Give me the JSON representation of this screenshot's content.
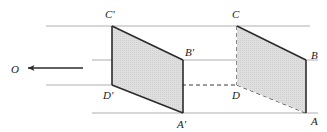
{
  "figure": {
    "background_color": "#ffffff",
    "stroke_color": "#2b2b2b",
    "guide_color": "#aeaeae",
    "fill_color": "#dcdcdc",
    "labels": {
      "center": "O",
      "near_top": "C'",
      "near_right": "B'",
      "near_bottom_left": "D'",
      "near_bottom": "A'",
      "far_top": "C",
      "far_right": "B",
      "far_bottom_left": "D",
      "far_bottom": "A"
    },
    "label_positions": {
      "center": {
        "x": 13,
        "y": 72
      },
      "near_top": {
        "x": 106,
        "y": 17
      },
      "near_right": {
        "x": 186,
        "y": 54
      },
      "near_bottom_left": {
        "x": 104,
        "y": 98
      },
      "near_bottom": {
        "x": 178,
        "y": 127
      },
      "far_top": {
        "x": 232,
        "y": 17
      },
      "far_right": {
        "x": 311,
        "y": 58
      },
      "far_bottom_left": {
        "x": 232,
        "y": 98
      },
      "far_bottom": {
        "x": 311,
        "y": 124
      }
    },
    "vertices": {
      "C_prime": {
        "x": 112,
        "y": 26
      },
      "B_prime": {
        "x": 183,
        "y": 60
      },
      "A_prime": {
        "x": 183,
        "y": 113
      },
      "D_prime": {
        "x": 112,
        "y": 85
      },
      "C": {
        "x": 237,
        "y": 26
      },
      "B": {
        "x": 306,
        "y": 60
      },
      "A": {
        "x": 306,
        "y": 113
      },
      "D": {
        "x": 237,
        "y": 85
      }
    },
    "guide_lines": [
      {
        "name": "ray-through-C",
        "x1": 46,
        "y1": 26,
        "x2": 310,
        "y2": 26
      },
      {
        "name": "ray-through-B",
        "x1": 92,
        "y1": 60,
        "x2": 318,
        "y2": 60
      },
      {
        "name": "ray-through-D",
        "x1": 46,
        "y1": 85,
        "x2": 112,
        "y2": 85
      },
      {
        "name": "ray-through-A",
        "x1": 92,
        "y1": 113,
        "x2": 318,
        "y2": 113
      }
    ],
    "arrow": {
      "name": "direction-of-projection",
      "tip_x": 26,
      "tail_x": 83,
      "y": 68
    },
    "dashed_edges": [
      {
        "name": "edge-D-prime-to-D",
        "x1": 112,
        "y1": 85,
        "x2": 237,
        "y2": 85
      },
      {
        "name": "edge-C-to-D",
        "x1": 237,
        "y1": 26,
        "x2": 237,
        "y2": 85
      },
      {
        "name": "edge-D-to-A",
        "x1": 237,
        "y1": 85,
        "x2": 306,
        "y2": 113
      }
    ],
    "near_quad_points": "112,26 183,60 183,113 112,85",
    "far_quad_points": "237,26 306,60 306,113 237,85"
  }
}
